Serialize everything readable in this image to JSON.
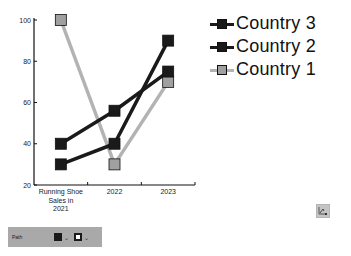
{
  "chart_data": {
    "type": "line",
    "title": "",
    "xlabel": "",
    "ylabel": "",
    "categories": [
      "Running Shoe Sales in 2021",
      "2022",
      "2023"
    ],
    "category_label_lines": [
      [
        "Running Shoe",
        "Sales in",
        "2021"
      ],
      [
        "2022"
      ],
      [
        "2023"
      ]
    ],
    "ylim": [
      20,
      100
    ],
    "yticks": [
      20,
      40,
      60,
      80,
      100
    ],
    "grid": false,
    "legend_position": "right-top",
    "series": [
      {
        "name": "Country 3",
        "values": [
          40,
          56,
          75
        ],
        "color": "#1a1a1a",
        "marker": "square"
      },
      {
        "name": "Country 2",
        "values": [
          30,
          40,
          90
        ],
        "color": "#1a1a1a",
        "marker": "square"
      },
      {
        "name": "Country 1",
        "values": [
          100,
          30,
          70
        ],
        "color": "#b3b3b3",
        "marker": "square"
      }
    ]
  },
  "legend": {
    "items": [
      {
        "label": "Country 3",
        "line_color": "#1a1a1a",
        "marker_color": "#1a1a1a"
      },
      {
        "label": "Country 2",
        "line_color": "#1a1a1a",
        "marker_color": "#1a1a1a"
      },
      {
        "label": "Country 1",
        "line_color": "#b3b3b3",
        "marker_color": "#a0a0a0"
      }
    ]
  },
  "toolbar": {
    "label": "Path",
    "fill_swatch_color": "#1a1a1a",
    "stroke_swatch_color": "#1a1a1a",
    "chevron": "⌄"
  },
  "fx_button": {
    "icon": "chart-properties-icon"
  }
}
